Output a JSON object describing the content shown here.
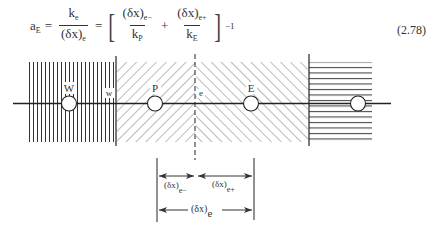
{
  "equation": {
    "number": "(2.78)",
    "lhs": {
      "symbol": "a",
      "sub": "E"
    },
    "frac1": {
      "num": "k",
      "num_sub": "e",
      "den": "(δx)",
      "den_sub": "e"
    },
    "frac2": {
      "num": "(δx)",
      "num_sub": "e−",
      "den": "k",
      "den_sub": "P"
    },
    "frac3": {
      "num": "(δx)",
      "num_sub": "e+",
      "den": "k",
      "den_sub": "E"
    },
    "equals": "=",
    "plus": "+",
    "exponent": "−1"
  },
  "figure": {
    "nodes": [
      {
        "label": "W",
        "x": 69
      },
      {
        "label": "P",
        "x": 155
      },
      {
        "label": "E",
        "x": 251
      },
      {
        "label": "",
        "x": 358
      }
    ],
    "faces": [
      {
        "label": "w",
        "x": 116
      },
      {
        "label": "e",
        "x": 195
      }
    ],
    "dimensions": {
      "e_minus": {
        "base": "(δx)",
        "sub": "e−"
      },
      "e_plus": {
        "base": "(δx)",
        "sub": "e+"
      },
      "e_total": {
        "base": "(δx)",
        "sub": "e"
      }
    },
    "colors": {
      "ink": "#333333",
      "background": "#ffffff"
    }
  }
}
